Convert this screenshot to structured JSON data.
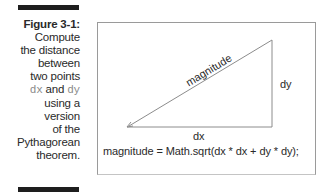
{
  "caption": {
    "figure_label": "Figure 3-1:",
    "lines": [
      "Compute",
      "the distance",
      "between",
      "two points"
    ],
    "dx_code": "dx",
    "and_text": " and ",
    "dy_code": "dy",
    "lines_after": [
      "using a",
      "version",
      "of the",
      "Pythagorean",
      "theorem."
    ]
  },
  "diagram": {
    "hypotenuse_label": "magnitude",
    "horizontal_label": "dx",
    "vertical_label": "dy",
    "formula": "magnitude = Math.sqrt(dx * dx + dy * dy);",
    "colors": {
      "line": "#8c8c8c",
      "border": "#9a9a9a",
      "bar": "#1e1e1e",
      "code_text": "#8a8a8a"
    }
  }
}
